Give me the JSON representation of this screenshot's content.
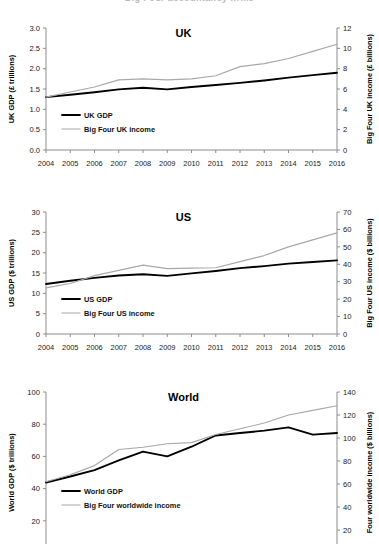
{
  "figure": {
    "clipped_title": "Big Four accountancy firms",
    "years": [
      2004,
      2005,
      2006,
      2007,
      2008,
      2009,
      2010,
      2011,
      2012,
      2013,
      2014,
      2015,
      2016
    ]
  },
  "chart_data": [
    {
      "type": "line",
      "title": "UK",
      "xlabel": "",
      "ylabel": "UK GDP (£ trillions)",
      "y2label": "Big Four UK income (£ billions)",
      "x": [
        2004,
        2005,
        2006,
        2007,
        2008,
        2009,
        2010,
        2011,
        2012,
        2013,
        2014,
        2015,
        2016
      ],
      "xtick_labels": [
        "2004",
        "2005",
        "2006",
        "2007",
        "2008",
        "2009",
        "2010",
        "2011",
        "2012",
        "2013",
        "2014",
        "2015",
        "2016"
      ],
      "ylim": [
        0.0,
        3.0
      ],
      "yticks": [
        0.0,
        0.5,
        1.0,
        1.5,
        2.0,
        2.5,
        3.0
      ],
      "ytick_labels": [
        "0.0",
        "0.5",
        "1.0",
        "1.5",
        "2.0",
        "2.5",
        "3.0"
      ],
      "y2lim": [
        0,
        12
      ],
      "y2ticks": [
        0,
        2,
        4,
        6,
        8,
        10,
        12
      ],
      "y2tick_labels": [
        "0",
        "2",
        "4",
        "6",
        "8",
        "10",
        "12"
      ],
      "grid": false,
      "legend_position": "lower-left",
      "series": [
        {
          "name": "UK GDP",
          "axis": "left",
          "color": "#000000",
          "width": "thick",
          "values": [
            1.3,
            1.36,
            1.42,
            1.49,
            1.53,
            1.49,
            1.55,
            1.6,
            1.65,
            1.71,
            1.78,
            1.84,
            1.9
          ]
        },
        {
          "name": "Big Four UK income",
          "axis": "right",
          "color": "#a8a8a8",
          "width": "thin",
          "values": [
            5.2,
            5.7,
            6.2,
            6.9,
            7.0,
            6.9,
            7.0,
            7.3,
            8.2,
            8.5,
            9.0,
            9.7,
            10.4
          ]
        }
      ]
    },
    {
      "type": "line",
      "title": "US",
      "xlabel": "",
      "ylabel": "US GDP ($ trillions)",
      "y2label": "Big Four US income ($ billions)",
      "x": [
        2004,
        2005,
        2006,
        2007,
        2008,
        2009,
        2010,
        2011,
        2012,
        2013,
        2014,
        2015,
        2016
      ],
      "xtick_labels": [
        "2004",
        "2005",
        "2006",
        "2007",
        "2008",
        "2009",
        "2010",
        "2011",
        "2012",
        "2013",
        "2014",
        "2015",
        "2016"
      ],
      "ylim": [
        0,
        30
      ],
      "yticks": [
        0,
        5,
        10,
        15,
        20,
        25,
        30
      ],
      "ytick_labels": [
        "0",
        "5",
        "10",
        "15",
        "20",
        "25",
        "30"
      ],
      "y2lim": [
        0,
        70
      ],
      "y2ticks": [
        0,
        10,
        20,
        30,
        40,
        50,
        60,
        70
      ],
      "y2tick_labels": [
        "0",
        "10",
        "20",
        "30",
        "40",
        "50",
        "60",
        "70"
      ],
      "grid": false,
      "legend_position": "lower-left",
      "series": [
        {
          "name": "US GDP",
          "axis": "left",
          "color": "#000000",
          "width": "thick",
          "values": [
            12.3,
            13.1,
            13.8,
            14.4,
            14.7,
            14.3,
            14.9,
            15.5,
            16.2,
            16.7,
            17.3,
            17.7,
            18.1
          ]
        },
        {
          "name": "Big Four US income",
          "axis": "right",
          "color": "#a8a8a8",
          "width": "thin",
          "values": [
            26.5,
            29.0,
            33.5,
            36.5,
            39.5,
            37.5,
            37.8,
            38.0,
            41.5,
            45.0,
            50.0,
            54.0,
            58.0
          ]
        }
      ]
    },
    {
      "type": "line",
      "title": "World",
      "xlabel": "",
      "ylabel": "World GDP ($ trillions)",
      "y2label": "Four worldwide income ($ billions)",
      "x": [
        2004,
        2005,
        2006,
        2007,
        2008,
        2009,
        2010,
        2011,
        2012,
        2013,
        2014,
        2015,
        2016
      ],
      "xtick_labels": [],
      "ylim": [
        0,
        100
      ],
      "yticks": [
        20,
        40,
        60,
        80,
        100
      ],
      "ytick_labels": [
        "20",
        "40",
        "60",
        "80",
        "100"
      ],
      "y2lim": [
        0,
        140
      ],
      "y2ticks": [
        20,
        40,
        60,
        80,
        100,
        120,
        140
      ],
      "y2tick_labels": [
        "20",
        "40",
        "60",
        "80",
        "100",
        "120",
        "140"
      ],
      "grid": false,
      "legend_position": "lower-left",
      "series": [
        {
          "name": "World GDP",
          "axis": "left",
          "color": "#000000",
          "width": "thick",
          "values": [
            43.8,
            47.5,
            51.5,
            57.5,
            63.0,
            60.0,
            66.0,
            73.0,
            74.5,
            76.0,
            78.0,
            73.5,
            74.5
          ]
        },
        {
          "name": "Big Four worldwide income",
          "axis": "right",
          "color": "#a8a8a8",
          "width": "thin",
          "values": [
            62,
            68,
            76,
            90,
            92,
            95,
            96,
            103,
            108,
            113,
            120,
            124,
            128
          ]
        }
      ]
    }
  ]
}
